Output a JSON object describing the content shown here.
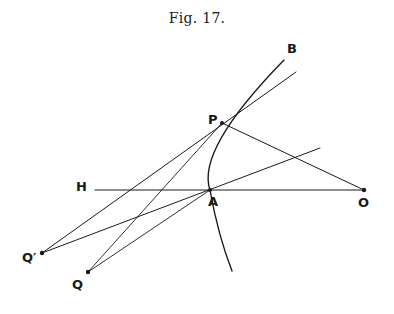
{
  "figure": {
    "title": "Fig. 17."
  },
  "diagram": {
    "points": {
      "B": {
        "label": "B",
        "x": 284,
        "y": 60,
        "label_x": 287,
        "label_y": 53
      },
      "P": {
        "label": "P",
        "x": 222,
        "y": 123,
        "label_x": 208,
        "label_y": 124
      },
      "H": {
        "label": "H",
        "x": 95,
        "y": 190,
        "label_x": 76,
        "label_y": 191
      },
      "A": {
        "label": "A",
        "x": 210,
        "y": 190,
        "label_x": 208,
        "label_y": 206
      },
      "O": {
        "label": "O",
        "x": 364,
        "y": 190,
        "label_x": 358,
        "label_y": 207
      },
      "Qprime": {
        "label": "Q′",
        "x": 42,
        "y": 253,
        "label_x": 22,
        "label_y": 262
      },
      "Q": {
        "label": "Q",
        "x": 88,
        "y": 272,
        "label_x": 72,
        "label_y": 289
      }
    },
    "stroke_color": "#1a1a1a"
  }
}
